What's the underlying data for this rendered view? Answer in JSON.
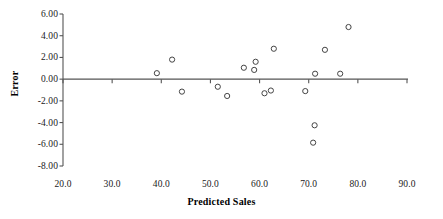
{
  "chart_data": {
    "type": "scatter",
    "title": "",
    "xlabel": "Predicted Sales",
    "ylabel": "Error",
    "xlim": [
      20.0,
      90.0
    ],
    "ylim": [
      -8.0,
      6.0
    ],
    "xticks": [
      20.0,
      30.0,
      40.0,
      50.0,
      60.0,
      70.0,
      80.0,
      90.0
    ],
    "yticks": [
      6.0,
      4.0,
      2.0,
      0.0,
      -2.0,
      -4.0,
      -6.0,
      -8.0
    ],
    "xtick_labels": [
      "20.0",
      "30.0",
      "40.0",
      "50.0",
      "60.0",
      "70.0",
      "80.0",
      "90.0"
    ],
    "ytick_labels": [
      "6.00",
      "4.00",
      "2.00",
      "0.00",
      "-2.00",
      "-4.00",
      "-6.00",
      "-8.00"
    ],
    "grid": false,
    "legend": null,
    "marker": "open-circle",
    "marker_color": "#444444",
    "zero_line": true,
    "points": [
      {
        "x": 39.1,
        "y": 0.55
      },
      {
        "x": 42.2,
        "y": 1.8
      },
      {
        "x": 44.2,
        "y": -1.15
      },
      {
        "x": 51.5,
        "y": -0.7
      },
      {
        "x": 53.4,
        "y": -1.55
      },
      {
        "x": 56.8,
        "y": 1.05
      },
      {
        "x": 58.9,
        "y": 0.85
      },
      {
        "x": 59.2,
        "y": 1.6
      },
      {
        "x": 61.0,
        "y": -1.3
      },
      {
        "x": 62.3,
        "y": -1.05
      },
      {
        "x": 62.9,
        "y": 2.8
      },
      {
        "x": 69.3,
        "y": -1.1
      },
      {
        "x": 71.3,
        "y": 0.5
      },
      {
        "x": 71.2,
        "y": -4.25
      },
      {
        "x": 70.9,
        "y": -5.85
      },
      {
        "x": 73.3,
        "y": 2.7
      },
      {
        "x": 76.4,
        "y": 0.5
      },
      {
        "x": 78.1,
        "y": 4.8
      }
    ]
  },
  "axes": {
    "x_title": "Predicted Sales",
    "y_title": "Error"
  }
}
